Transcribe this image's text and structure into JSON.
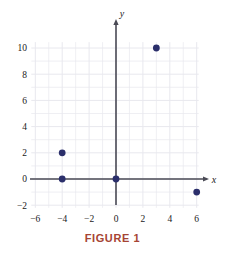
{
  "figure": {
    "caption": "FIGURE 1",
    "caption_color": "#a64434",
    "background_color": "#ffffff"
  },
  "chart_data": {
    "type": "scatter",
    "title": "",
    "subtitle": "",
    "xlabel": "x",
    "ylabel": "y",
    "xlim": [
      -6.5,
      6.5
    ],
    "ylim": [
      -2.5,
      10.6
    ],
    "xticks": [
      -6,
      -4,
      -2,
      0,
      2,
      4,
      6
    ],
    "xtick_labels": [
      "−6",
      "−4",
      "−2",
      "0",
      "2",
      "4",
      "6"
    ],
    "yticks": [
      -2,
      0,
      2,
      4,
      6,
      8,
      10
    ],
    "ytick_labels": [
      "−2",
      "0",
      "2",
      "4",
      "6",
      "8",
      "10"
    ],
    "grid": true,
    "grid_spacing": 1,
    "grid_color": "#e8e8ee",
    "axis_color": "#4a4a55",
    "legend": null,
    "legend_position": "none",
    "point_color": "#2b2f6b",
    "point_size": 3.4,
    "points": [
      {
        "x": 3,
        "y": 10,
        "label": "(3, 10)"
      },
      {
        "x": -4,
        "y": 2,
        "label": "(-4, 2)"
      },
      {
        "x": -4,
        "y": 0,
        "label": "(-4, 0)"
      },
      {
        "x": 0,
        "y": 0,
        "label": "(0, 0)"
      },
      {
        "x": 6,
        "y": -1,
        "label": "(6, -1)"
      }
    ]
  }
}
